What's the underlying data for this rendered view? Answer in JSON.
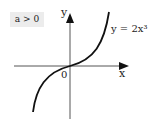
{
  "diagram": {
    "condition_label": "a > 0",
    "equation_label": "y = 2x³",
    "x_axis_label": "x",
    "y_axis_label": "y",
    "origin_label": "0",
    "curve": "cubic",
    "colors": {
      "curve": "#111111",
      "axes": "#333333",
      "label_bg": "#ececec"
    }
  }
}
